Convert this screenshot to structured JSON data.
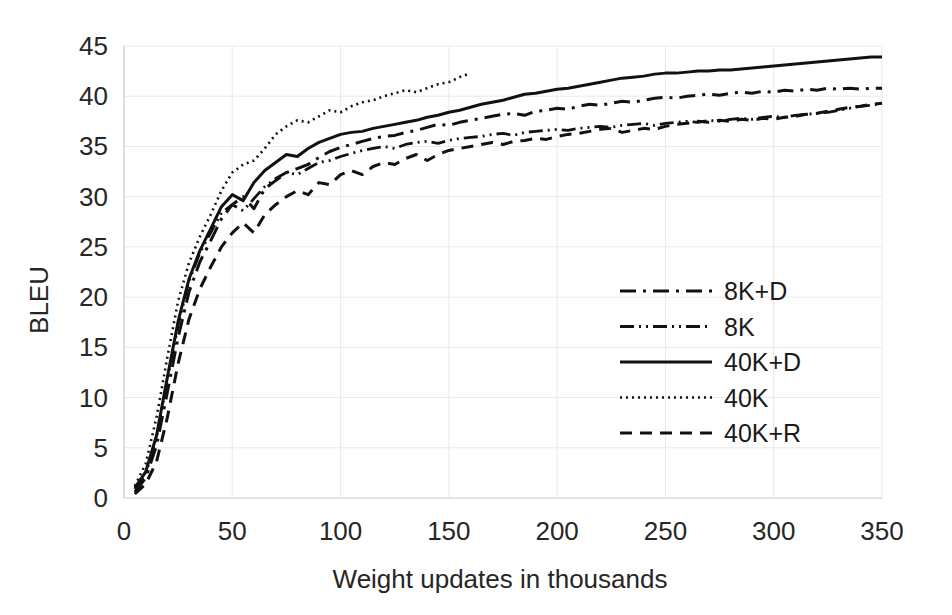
{
  "chart_data": {
    "type": "line",
    "title": "",
    "xlabel": "Weight updates in thousands",
    "ylabel": "BLEU",
    "xlim": [
      0,
      350
    ],
    "ylim": [
      0,
      45
    ],
    "xticks": [
      0,
      50,
      100,
      150,
      200,
      250,
      300,
      350
    ],
    "yticks": [
      0,
      5,
      10,
      15,
      20,
      25,
      30,
      35,
      40,
      45
    ],
    "grid": true,
    "legend_position": "center-right-inside",
    "series": [
      {
        "name": "8K+D",
        "style": "long-dash-dot",
        "dasharray": "16,7,3,7",
        "x": [
          5,
          10,
          15,
          20,
          25,
          30,
          35,
          40,
          45,
          50,
          55,
          60,
          65,
          70,
          75,
          80,
          85,
          90,
          95,
          100,
          105,
          110,
          115,
          120,
          125,
          130,
          135,
          140,
          145,
          150,
          155,
          160,
          165,
          170,
          175,
          180,
          185,
          190,
          195,
          200,
          205,
          210,
          215,
          220,
          225,
          230,
          235,
          240,
          245,
          250,
          255,
          260,
          265,
          270,
          275,
          280,
          285,
          290,
          295,
          300,
          305,
          310,
          315,
          320,
          325,
          330,
          335,
          340,
          345,
          350
        ],
        "y": [
          0.6,
          2.0,
          5.2,
          10.5,
          16.0,
          20.5,
          23.5,
          25.6,
          27.8,
          29.2,
          30.0,
          28.8,
          30.8,
          31.6,
          32.4,
          32.8,
          33.2,
          33.9,
          34.5,
          34.9,
          35.2,
          35.5,
          35.8,
          36.0,
          36.1,
          36.4,
          36.6,
          36.9,
          37.2,
          37.1,
          37.4,
          37.6,
          37.8,
          38.0,
          38.2,
          38.3,
          38.1,
          38.5,
          38.6,
          38.8,
          38.7,
          39.0,
          39.2,
          39.1,
          39.3,
          39.5,
          39.4,
          39.6,
          39.8,
          39.9,
          39.8,
          40.0,
          40.1,
          40.2,
          40.1,
          40.3,
          40.4,
          40.3,
          40.5,
          40.4,
          40.6,
          40.5,
          40.7,
          40.6,
          40.8,
          40.7,
          40.8,
          40.7,
          40.8,
          40.8
        ]
      },
      {
        "name": "8K",
        "style": "dash-dot-dot",
        "dasharray": "14,5,2,5,2,5",
        "x": [
          5,
          10,
          15,
          20,
          25,
          30,
          35,
          40,
          45,
          50,
          55,
          60,
          65,
          70,
          75,
          80,
          85,
          90,
          95,
          100,
          105,
          110,
          115,
          120,
          125,
          130,
          135,
          140,
          145,
          150,
          155,
          160,
          165,
          170,
          175,
          180,
          185,
          190,
          195,
          200,
          205,
          210,
          215,
          220,
          225,
          230,
          235,
          240,
          245,
          250,
          255,
          260,
          265,
          270,
          275,
          280,
          285,
          290,
          295,
          300,
          305,
          310,
          315,
          320,
          325,
          330,
          335,
          340,
          345,
          350
        ],
        "y": [
          0.9,
          2.4,
          6.0,
          11.8,
          17.2,
          21.6,
          24.4,
          26.4,
          28.4,
          29.2,
          28.6,
          29.8,
          31.0,
          31.8,
          32.4,
          32.2,
          32.8,
          33.4,
          33.6,
          34.0,
          34.3,
          34.6,
          34.8,
          35.0,
          34.8,
          35.2,
          35.4,
          35.5,
          35.3,
          35.6,
          35.8,
          35.9,
          36.0,
          36.2,
          36.3,
          36.1,
          36.4,
          36.5,
          36.6,
          36.7,
          36.6,
          36.8,
          36.9,
          37.0,
          36.9,
          37.1,
          37.2,
          37.3,
          37.1,
          37.3,
          37.4,
          37.5,
          37.4,
          37.6,
          37.5,
          37.7,
          37.8,
          37.7,
          37.9,
          38.0,
          37.9,
          38.1,
          38.2,
          38.3,
          38.4,
          38.6,
          38.8,
          39.0,
          39.1,
          39.3
        ]
      },
      {
        "name": "40K+D",
        "style": "solid",
        "dasharray": "none",
        "x": [
          5,
          10,
          15,
          20,
          25,
          30,
          35,
          40,
          45,
          50,
          55,
          60,
          65,
          70,
          75,
          80,
          85,
          90,
          95,
          100,
          105,
          110,
          115,
          120,
          125,
          130,
          135,
          140,
          145,
          150,
          155,
          160,
          165,
          170,
          175,
          180,
          185,
          190,
          195,
          200,
          205,
          210,
          215,
          220,
          225,
          230,
          235,
          240,
          245,
          250,
          255,
          260,
          265,
          270,
          275,
          280,
          285,
          290,
          295,
          300,
          305,
          310,
          315,
          320,
          325,
          330,
          335,
          340,
          345,
          350
        ],
        "y": [
          1.0,
          2.6,
          6.2,
          12.0,
          17.6,
          21.8,
          24.6,
          26.8,
          29.0,
          30.2,
          29.6,
          31.4,
          32.6,
          33.4,
          34.2,
          34.0,
          34.8,
          35.4,
          35.8,
          36.2,
          36.4,
          36.5,
          36.8,
          37.0,
          37.2,
          37.4,
          37.6,
          37.9,
          38.1,
          38.4,
          38.6,
          38.9,
          39.2,
          39.4,
          39.6,
          39.9,
          40.2,
          40.3,
          40.5,
          40.7,
          40.8,
          41.0,
          41.2,
          41.4,
          41.6,
          41.8,
          41.9,
          42.0,
          42.2,
          42.3,
          42.3,
          42.4,
          42.5,
          42.5,
          42.6,
          42.6,
          42.7,
          42.8,
          42.9,
          43.0,
          43.1,
          43.2,
          43.3,
          43.4,
          43.5,
          43.6,
          43.7,
          43.8,
          43.9,
          43.9
        ]
      },
      {
        "name": "40K",
        "style": "dotted",
        "dasharray": "2,4",
        "x": [
          5,
          10,
          15,
          20,
          25,
          30,
          35,
          40,
          45,
          50,
          55,
          60,
          65,
          70,
          75,
          80,
          85,
          90,
          95,
          100,
          105,
          110,
          115,
          120,
          125,
          130,
          135,
          140,
          145,
          150,
          155,
          160
        ],
        "y": [
          1.2,
          3.4,
          8.0,
          14.0,
          19.6,
          23.4,
          26.0,
          28.2,
          30.6,
          32.4,
          33.2,
          33.6,
          34.8,
          36.2,
          37.0,
          37.6,
          37.4,
          38.0,
          38.6,
          38.4,
          39.0,
          39.4,
          39.6,
          40.0,
          40.3,
          40.6,
          40.4,
          40.8,
          41.2,
          41.4,
          41.9,
          42.3
        ]
      },
      {
        "name": "40K+R",
        "style": "medium-dash",
        "dasharray": "12,8",
        "x": [
          5,
          10,
          15,
          20,
          25,
          30,
          35,
          40,
          45,
          50,
          55,
          60,
          65,
          70,
          75,
          80,
          85,
          90,
          95,
          100,
          105,
          110,
          115,
          120,
          125,
          130,
          135,
          140,
          145,
          150,
          155,
          160,
          165,
          170,
          175,
          180,
          185,
          190,
          195,
          200,
          205,
          210,
          215,
          220,
          225,
          230,
          235,
          240,
          245,
          250,
          255,
          260,
          265,
          270,
          275,
          280,
          285,
          290,
          295,
          300,
          305,
          310,
          315,
          320,
          325,
          330,
          335,
          340,
          345,
          350
        ],
        "y": [
          0.4,
          1.4,
          3.6,
          8.0,
          13.4,
          17.8,
          20.8,
          23.0,
          25.0,
          26.4,
          27.4,
          26.4,
          28.2,
          29.2,
          30.0,
          30.6,
          30.2,
          31.4,
          31.2,
          32.2,
          32.6,
          32.2,
          33.0,
          33.4,
          33.2,
          33.8,
          34.2,
          33.6,
          34.2,
          34.6,
          34.8,
          35.0,
          35.2,
          35.4,
          35.2,
          35.5,
          35.6,
          35.8,
          35.7,
          36.0,
          36.2,
          36.3,
          36.5,
          36.7,
          36.8,
          36.4,
          36.6,
          36.8,
          36.7,
          37.0,
          37.2,
          37.3,
          37.5,
          37.4,
          37.6,
          37.5,
          37.7,
          37.6,
          37.8,
          37.7,
          37.9,
          38.0,
          38.2,
          38.3,
          38.5,
          38.7,
          38.9,
          39.0,
          39.2,
          39.3
        ]
      }
    ]
  },
  "legend": {
    "entries": [
      {
        "label": "8K+D"
      },
      {
        "label": "8K"
      },
      {
        "label": "40K+D"
      },
      {
        "label": "40K"
      },
      {
        "label": "40K+R"
      }
    ]
  },
  "axes": {
    "y_title": "BLEU",
    "x_title": "Weight updates in thousands",
    "y_tick_labels": [
      "45",
      "40",
      "35",
      "30",
      "25",
      "20",
      "15",
      "10",
      "5",
      "0"
    ],
    "x_tick_labels": [
      "0",
      "50",
      "100",
      "150",
      "200",
      "250",
      "300",
      "350"
    ]
  },
  "colors": {
    "line": "#111111",
    "grid": "#e9e9ec",
    "text": "#262626",
    "background": "#ffffff"
  }
}
